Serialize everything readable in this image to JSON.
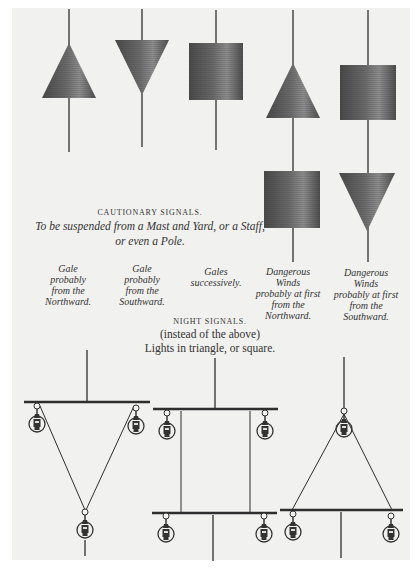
{
  "day_signals": {
    "heading": "CAUTIONARY SIGNALS.",
    "subtitle_line1": "To be suspended from a Mast and Yard, or a Staff,",
    "subtitle_line2": "or even a Pole.",
    "signals": [
      {
        "shapes": [
          "cone-point-up"
        ],
        "label": [
          "Gale",
          "probably",
          "from the",
          "Northward."
        ]
      },
      {
        "shapes": [
          "cone-point-down"
        ],
        "label": [
          "Gale",
          "probably",
          "from the",
          "Southward."
        ]
      },
      {
        "shapes": [
          "drum"
        ],
        "label": [
          "Gales",
          "successively."
        ]
      },
      {
        "shapes": [
          "cone-point-up",
          "drum"
        ],
        "label": [
          "Dangerous",
          "Winds",
          "probably at first",
          "from the",
          "Northward."
        ]
      },
      {
        "shapes": [
          "drum",
          "cone-point-down"
        ],
        "label": [
          "Dangerous",
          "Winds",
          "probably at first",
          "from the",
          "Southward."
        ]
      }
    ]
  },
  "night_signals": {
    "heading": "NIGHT SIGNALS.",
    "line1": "(instead of the above)",
    "line2": "Lights in triangle, or square.",
    "arrangements": [
      "inverted-triangle",
      "square",
      "triangle"
    ]
  },
  "colors": {
    "page": "#f1f1ef",
    "shape_dark": "#4e4e4e",
    "shape_light": "#8a8a8a",
    "line": "#2e2e2e"
  }
}
